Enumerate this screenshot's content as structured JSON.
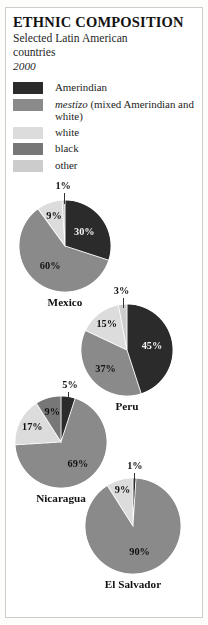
{
  "figure": {
    "title": "ETHNIC COMPOSITION",
    "subtitle": "Selected Latin American countries",
    "year": "2000"
  },
  "legend": {
    "items": [
      {
        "label": "Amerindian",
        "label_italic": "",
        "color": "#2b2b2b"
      },
      {
        "label": " (mixed Amerindian and white)",
        "label_italic": "mestizo",
        "color": "#8a8a8a"
      },
      {
        "label": "white",
        "label_italic": "",
        "color": "#dcdcdc"
      },
      {
        "label": "black",
        "label_italic": "",
        "color": "#777777"
      },
      {
        "label": "other",
        "label_italic": "",
        "color": "#cccccc"
      }
    ]
  },
  "chart_data": {
    "type": "pie",
    "title": "ETHNIC COMPOSITION",
    "subtitle": "Selected Latin American countries",
    "year": "2000",
    "legend_position": "top",
    "categories": [
      "Amerindian",
      "mestizo (mixed Amerindian and white)",
      "white",
      "black",
      "other"
    ],
    "colors": [
      "#2b2b2b",
      "#8a8a8a",
      "#dcdcdc",
      "#777777",
      "#cccccc"
    ],
    "charts": [
      {
        "name": "Mexico",
        "slices": [
          {
            "category": "Amerindian",
            "value": 30,
            "label": "30%",
            "color": "#2b2b2b"
          },
          {
            "category": "mestizo",
            "value": 60,
            "label": "60%",
            "color": "#8a8a8a"
          },
          {
            "category": "white",
            "value": 9,
            "label": "9%",
            "color": "#dcdcdc"
          },
          {
            "category": "other",
            "value": 1,
            "label": "1%",
            "color": "#cccccc"
          }
        ]
      },
      {
        "name": "Peru",
        "slices": [
          {
            "category": "Amerindian",
            "value": 45,
            "label": "45%",
            "color": "#2b2b2b"
          },
          {
            "category": "mestizo",
            "value": 37,
            "label": "37%",
            "color": "#8a8a8a"
          },
          {
            "category": "white",
            "value": 15,
            "label": "15%",
            "color": "#dcdcdc"
          },
          {
            "category": "other",
            "value": 3,
            "label": "3%",
            "color": "#cccccc"
          }
        ]
      },
      {
        "name": "Nicaragua",
        "slices": [
          {
            "category": "Amerindian",
            "value": 5,
            "label": "5%",
            "color": "#2b2b2b"
          },
          {
            "category": "mestizo",
            "value": 69,
            "label": "69%",
            "color": "#8a8a8a"
          },
          {
            "category": "white",
            "value": 17,
            "label": "17%",
            "color": "#dcdcdc"
          },
          {
            "category": "black",
            "value": 9,
            "label": "9%",
            "color": "#777777"
          }
        ]
      },
      {
        "name": "El Salvador",
        "slices": [
          {
            "category": "Amerindian",
            "value": 1,
            "label": "1%",
            "color": "#2b2b2b"
          },
          {
            "category": "mestizo",
            "value": 90,
            "label": "90%",
            "color": "#8a8a8a"
          },
          {
            "category": "white",
            "value": 9,
            "label": "9%",
            "color": "#dcdcdc"
          }
        ]
      }
    ]
  }
}
